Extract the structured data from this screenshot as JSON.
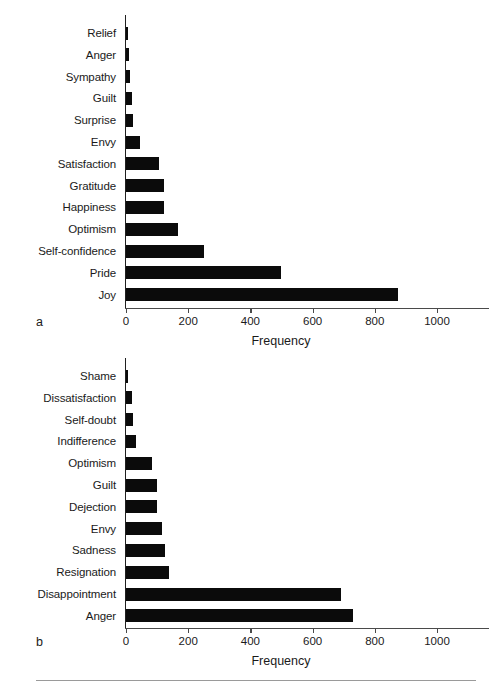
{
  "figure": {
    "panel_a_letter": "a",
    "panel_b_letter": "b"
  },
  "axis": {
    "title": "Frequency",
    "ticks": [
      "0",
      "200",
      "400",
      "600",
      "800",
      "1000"
    ],
    "tick_values": [
      0,
      200,
      400,
      600,
      800,
      1000
    ],
    "xlim": [
      0,
      1060
    ],
    "bar_color": "#0b0b0b",
    "axis_color": "#4a4a4a"
  },
  "chart_data": [
    {
      "type": "bar",
      "orientation": "horizontal",
      "panel": "a",
      "title": "",
      "xlabel": "Frequency",
      "ylabel": "",
      "xlim": [
        0,
        1060
      ],
      "grid": false,
      "legend": "none",
      "categories": [
        "Relief",
        "Anger",
        "Sympathy",
        "Guilt",
        "Surprise",
        "Envy",
        "Satisfaction",
        "Gratitude",
        "Happiness",
        "Optimism",
        "Self-confidence",
        "Pride",
        "Joy"
      ],
      "values": [
        5,
        10,
        14,
        18,
        22,
        44,
        105,
        122,
        122,
        168,
        250,
        497,
        874
      ]
    },
    {
      "type": "bar",
      "orientation": "horizontal",
      "panel": "b",
      "title": "",
      "xlabel": "Frequency",
      "ylabel": "",
      "xlim": [
        0,
        1060
      ],
      "grid": false,
      "legend": "none",
      "categories": [
        "Shame",
        "Dissatisfaction",
        "Self-doubt",
        "Indifference",
        "Optimism",
        "Guilt",
        "Dejection",
        "Envy",
        "Sadness",
        "Resignation",
        "Disappointment",
        "Anger"
      ],
      "values": [
        8,
        18,
        22,
        32,
        82,
        100,
        100,
        115,
        124,
        138,
        692,
        730
      ]
    }
  ]
}
